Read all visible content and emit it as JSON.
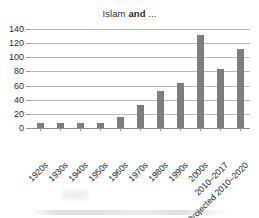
{
  "chart_data": {
    "type": "bar",
    "title": "Islam and ...",
    "title_parts": {
      "pre": "Islam ",
      "bold": "and",
      "post": " ..."
    },
    "categories": [
      "1920s",
      "1930s",
      "1940s",
      "1950s",
      "1960s",
      "1970s",
      "1980s",
      "1990s",
      "2000s",
      "2010–2017",
      "Projected 2010–2020"
    ],
    "values": [
      7,
      7,
      7,
      7,
      16,
      32,
      52,
      63,
      131,
      83,
      112
    ],
    "series": [
      {
        "name": "Islam and ...",
        "values": [
          7,
          7,
          7,
          7,
          16,
          32,
          52,
          63,
          131,
          83,
          112
        ]
      }
    ],
    "xlabel": "",
    "ylabel": "",
    "ylim": [
      0,
      140
    ],
    "yticks": [
      0,
      20,
      40,
      60,
      80,
      100,
      120,
      140
    ],
    "ytick_labels": [
      "0",
      "20",
      "40",
      "60",
      "80",
      "100",
      "120",
      "140"
    ],
    "grid": true,
    "grid_axis": "y",
    "legend": false,
    "legend_position": "none",
    "bar_color": "#7d7d7d",
    "grid_color": "#b9b9b9",
    "axis_color": "#8f8f8f",
    "text_color": "#222222",
    "background": "#ffffff",
    "xtick_rotation": -45
  }
}
